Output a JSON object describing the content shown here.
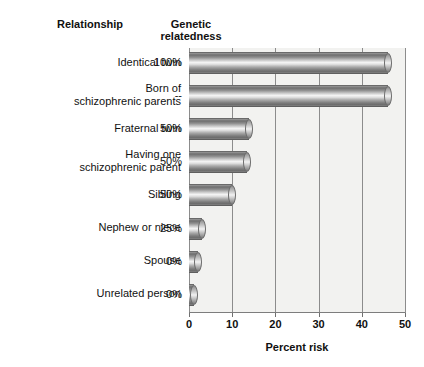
{
  "headers": {
    "relationship": "Relationship",
    "genetic": "Genetic\nrelatedness"
  },
  "artifact": {
    "line_a": "",
    "line_b": ""
  },
  "chart_data": {
    "type": "bar",
    "orientation": "horizontal",
    "title": "",
    "xlabel": "Percent risk",
    "ylabel": "",
    "xlim": [
      0,
      50
    ],
    "xticks": [
      0,
      10,
      20,
      30,
      40,
      50
    ],
    "xtick_labels": [
      "0",
      "10",
      "20",
      "30",
      "40",
      "50"
    ],
    "grid": true,
    "grid_axis": "x",
    "legend": false,
    "categories": [
      "Identical twin",
      "Born of schizophrenic parents",
      "Fraternal twin",
      "Having one schizophrenic parent",
      "Sibling",
      "Nephew or niece",
      "Spouse",
      "Unrelated person"
    ],
    "values": [
      46,
      46,
      14,
      13.5,
      10,
      3,
      2,
      1
    ],
    "annotations": {
      "genetic_relatedness": [
        "100%",
        "--",
        "50%",
        "50%",
        "50%",
        "25%",
        "0%",
        "0%"
      ]
    },
    "bar_style": "3d-cylinder-grayscale",
    "colors": {
      "bar_light": "#f4f4f4",
      "bar_mid": "#a9a9a9",
      "bar_dark": "#6a6a6a",
      "plot_background": "#f2f2f0",
      "gridline": "#8c8c8c",
      "text": "#111111"
    }
  },
  "rows": [
    {
      "label": "Identical twin",
      "genetic": "100%",
      "value": 46
    },
    {
      "label": "Born of\nschizophrenic parents",
      "genetic": "--",
      "value": 46
    },
    {
      "label": "Fraternal twin",
      "genetic": "50%",
      "value": 14
    },
    {
      "label": "Having one\nschizophrenic parent",
      "genetic": "50%",
      "value": 13.5
    },
    {
      "label": "Sibling",
      "genetic": "50%",
      "value": 10
    },
    {
      "label": "Nephew or niece",
      "genetic": "25%",
      "value": 3
    },
    {
      "label": "Spouse",
      "genetic": "0%",
      "value": 2
    },
    {
      "label": "Unrelated person",
      "genetic": "0%",
      "value": 1
    }
  ]
}
